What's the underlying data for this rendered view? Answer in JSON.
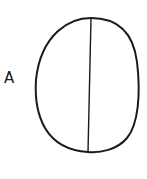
{
  "diagram": {
    "label": "A",
    "shape": "oval",
    "divider": "vertical line through center",
    "stroke_color": "#1a1a1a",
    "background": "#ffffff"
  }
}
